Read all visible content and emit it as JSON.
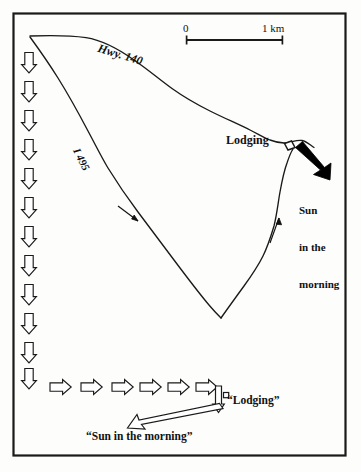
{
  "figure": {
    "type": "map"
  },
  "frame": {
    "border_color": "#1a1a1a",
    "background": "#fdfdfb"
  },
  "scale_bar": {
    "start_label": "0",
    "end_label": "1 km",
    "length_km": 1
  },
  "roads": [
    {
      "name": "hwy-140",
      "label": "Hwy. 140",
      "style": "curved line running from northwest corner southeast to lodging area"
    },
    {
      "name": "i-495",
      "label": "I 495",
      "style": "diagonal line running from northwest corner southeast to the valley point"
    },
    {
      "name": "return-road",
      "label": "",
      "style": "line from valley point north toward lodging"
    }
  ],
  "markers": {
    "lodging_map_label": "Lodging",
    "lodging_icon": "building-marker"
  },
  "annotations": {
    "sun_direction_map": "Sun\nin the\nmorning",
    "sun_direction_lines": [
      "Sun",
      "in the",
      "morning"
    ]
  },
  "legend": {
    "lodging_quote": "“Lodging”",
    "sun_quote": "“Sun in the morning”",
    "down_arrow_count": 13,
    "right_arrow_count": 6
  },
  "colors": {
    "ink": "#111111",
    "line": "#1a1a1a",
    "fill_white": "#ffffff",
    "sun_arrow": "#000000"
  }
}
